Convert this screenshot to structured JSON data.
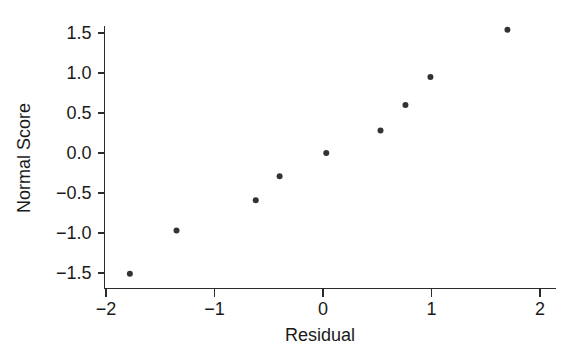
{
  "chart_data": {
    "type": "scatter",
    "title": "",
    "xlabel": "Residual",
    "ylabel": "Normal Score",
    "xlim": [
      -2.3,
      2.15
    ],
    "ylim": [
      -1.67,
      1.66
    ],
    "grid": false,
    "legend": null,
    "xticks": [
      -2,
      -1,
      0,
      1,
      2
    ],
    "xticklabels": [
      "−2",
      "−1",
      "0",
      "1",
      "2"
    ],
    "yticks": [
      -1.5,
      -1.0,
      -0.5,
      0.0,
      0.5,
      1.0,
      1.5
    ],
    "yticklabels": [
      "−1.5",
      "−1.0",
      "−0.5",
      "0.0",
      "0.5",
      "1.0",
      "1.5"
    ],
    "marker": "filled-circle",
    "marker_color": "#333333",
    "marker_size": 6,
    "x": [
      -1.78,
      -1.35,
      -0.62,
      -0.4,
      0.03,
      0.53,
      0.76,
      0.99,
      1.7
    ],
    "y": [
      -1.51,
      -0.97,
      -0.59,
      -0.29,
      0.0,
      0.28,
      0.6,
      0.95,
      1.54
    ],
    "points": [
      {
        "x": -1.78,
        "y": -1.51
      },
      {
        "x": -1.35,
        "y": -0.97
      },
      {
        "x": -0.62,
        "y": -0.59
      },
      {
        "x": -0.4,
        "y": -0.29
      },
      {
        "x": 0.03,
        "y": 0.0
      },
      {
        "x": 0.53,
        "y": 0.28
      },
      {
        "x": 0.76,
        "y": 0.6
      },
      {
        "x": 0.99,
        "y": 0.95
      },
      {
        "x": 1.7,
        "y": 1.54
      }
    ]
  },
  "figure": {
    "background_color": "#ffffff",
    "axis_color": "#2b2b2b",
    "text_color": "#1a1a1a"
  }
}
